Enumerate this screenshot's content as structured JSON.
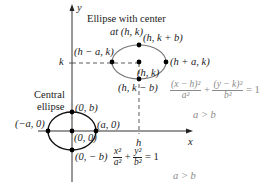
{
  "axes": {
    "x_label": "x",
    "y_label": "y",
    "h_tick": "h",
    "k_tick": "k"
  },
  "shifted_ellipse": {
    "title_line1": "Ellipse with center",
    "title_line2": "at (h, k)",
    "left_vertex": "(h − a, k)",
    "top_vertex": "(h, k + b)",
    "right_vertex": "(h + a, k)",
    "center": "(h, k)",
    "bottom_vertex": "(h, k − b)",
    "equation": {
      "num1": "(x − h)²",
      "den1": "a²",
      "plus": "+",
      "num2": "(y − k)²",
      "den2": "b²",
      "eq": "= 1"
    },
    "condition": "a > b"
  },
  "central_ellipse": {
    "title_line1": "Central",
    "title_line2": "ellipse",
    "top_vertex": "(0, b)",
    "left_vertex": "(−a, 0)",
    "right_vertex": "(a, 0)",
    "center": "(0, 0)",
    "bottom_vertex": "(0, − b)",
    "equation": {
      "num1": "x²",
      "den1": "a²",
      "plus": "+",
      "num2": "y²",
      "den2": "b²",
      "eq": "= 1"
    },
    "condition": "a > b"
  },
  "colors": {
    "axis": "#333333",
    "ellipse": "#777777",
    "central_ellipse": "#111111",
    "point": "#000000",
    "grey_text": "#8a8a8a"
  }
}
